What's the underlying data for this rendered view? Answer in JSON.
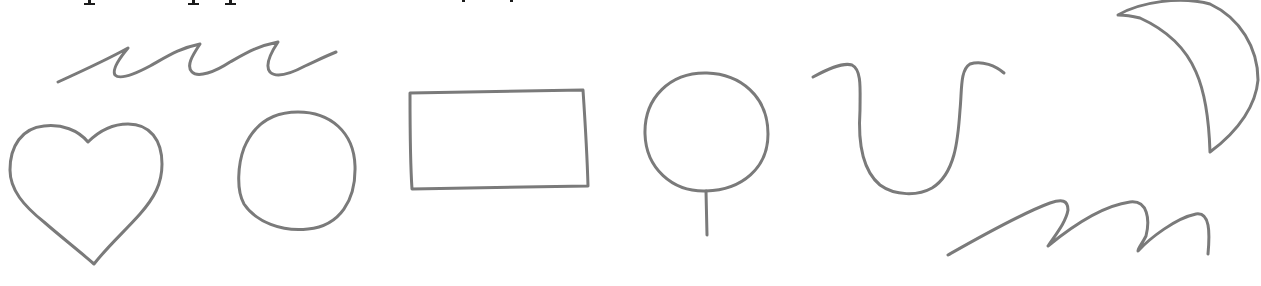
{
  "page": {
    "background": "#ffffff",
    "stroke_color": "#7a7a7a"
  },
  "shapes": [
    {
      "name": "wavy-line-top",
      "label": "wavy line"
    },
    {
      "name": "heart",
      "label": "heart"
    },
    {
      "name": "circle",
      "label": "circle"
    },
    {
      "name": "rectangle",
      "label": "rectangle"
    },
    {
      "name": "lollipop",
      "label": "circle with stick"
    },
    {
      "name": "u-curve",
      "label": "U-shaped curve"
    },
    {
      "name": "crescent-moon",
      "label": "crescent moon"
    },
    {
      "name": "wavy-line-bottom",
      "label": "wavy line (m-shaped)"
    }
  ]
}
